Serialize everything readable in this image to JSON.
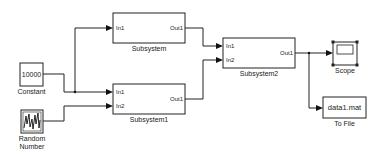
{
  "blocks": {
    "constant": {
      "label": "Constant",
      "value": "10000"
    },
    "random": {
      "label_line1": "Random",
      "label_line2": "Number"
    },
    "subsystem": {
      "label": "Subsystem",
      "in1": "In1",
      "out1": "Out1"
    },
    "subsystem1": {
      "label": "Subsystem1",
      "in1": "In1",
      "in2": "In2",
      "out1": "Out1"
    },
    "subsystem2": {
      "label": "Subsystem2",
      "in1": "In1",
      "in2": "In2",
      "out1": "Out1"
    },
    "scope": {
      "label": "Scope"
    },
    "tofile": {
      "label": "To File",
      "filename": "data1.mat"
    }
  }
}
